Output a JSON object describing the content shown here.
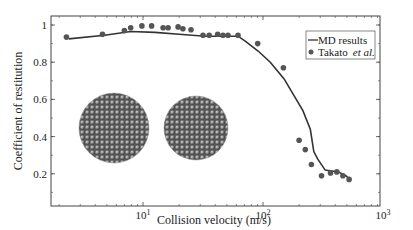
{
  "chart_data": {
    "type": "line",
    "title": "",
    "xlabel": "Collision velocity (m/s)",
    "ylabel": "Coefficient of restitution",
    "xscale": "log",
    "xlim": [
      1.7,
      1000
    ],
    "ylim": [
      0.1,
      1.05
    ],
    "grid": false,
    "legend_position": "upper right",
    "x_ticks": [
      {
        "value": 10,
        "label_base": "10",
        "label_exp": "1"
      },
      {
        "value": 100,
        "label_base": "10",
        "label_exp": "2"
      },
      {
        "value": 1000,
        "label_base": "10",
        "label_exp": "3"
      }
    ],
    "y_ticks": [
      {
        "value": 0.2,
        "label": "0.2"
      },
      {
        "value": 0.4,
        "label": "0.4"
      },
      {
        "value": 0.6,
        "label": "0.6"
      },
      {
        "value": 0.8,
        "label": "0.8"
      },
      {
        "value": 1.0,
        "label": "1"
      }
    ],
    "series": [
      {
        "name": "MD results",
        "kind": "line",
        "color": "#333333",
        "x": [
          2.4,
          4.8,
          7.9,
          12.6,
          20,
          33,
          46,
          62,
          72,
          91,
          115,
          150,
          215,
          248,
          265,
          285,
          330,
          425,
          490,
          530
        ],
        "y": [
          0.925,
          0.945,
          0.965,
          0.96,
          0.95,
          0.94,
          0.94,
          0.94,
          0.91,
          0.86,
          0.8,
          0.71,
          0.54,
          0.44,
          0.32,
          0.28,
          0.22,
          0.21,
          0.19,
          0.17
        ]
      },
      {
        "name": "Takato et al.",
        "kind": "scatter",
        "color": "#555555",
        "x": [
          2.3,
          4.6,
          7.0,
          7.9,
          9.8,
          11.8,
          14.7,
          16.2,
          19.6,
          21.5,
          25.1,
          31.6,
          35.6,
          41.9,
          46.4,
          51.1,
          61.9,
          90.4,
          148,
          200,
          225,
          253,
          307,
          365,
          412,
          463,
          522
        ],
        "y": [
          0.935,
          0.95,
          0.97,
          0.985,
          0.995,
          0.995,
          0.985,
          0.985,
          0.99,
          0.98,
          0.975,
          0.945,
          0.945,
          0.95,
          0.945,
          0.945,
          0.945,
          0.9,
          0.77,
          0.38,
          0.33,
          0.25,
          0.19,
          0.205,
          0.21,
          0.19,
          0.17
        ]
      }
    ],
    "legend": [
      {
        "label": "MD results",
        "symbol": "line"
      },
      {
        "label": "Takato",
        "label_italic": "et al.",
        "symbol": "dot"
      }
    ],
    "annotations": [
      {
        "type": "image",
        "description": "two spherical particle clusters (molecular dynamics nanoparticles)",
        "count": 2
      }
    ]
  }
}
